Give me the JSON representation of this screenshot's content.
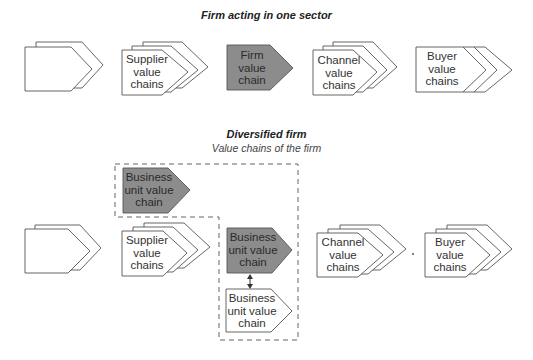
{
  "section_one": {
    "title": "Firm acting in one sector",
    "shapes": [
      {
        "id": "unlabeled",
        "label": "",
        "style": "white",
        "layers": 2
      },
      {
        "id": "supplier",
        "label": "Supplier\nvalue\nchains",
        "style": "white",
        "layers": 3
      },
      {
        "id": "firm",
        "label": "Firm\nvalue\nchain",
        "style": "gray",
        "layers": 1
      },
      {
        "id": "channel",
        "label": "Channel\nvalue\nchains",
        "style": "white",
        "layers": 3
      },
      {
        "id": "buyer",
        "label": "Buyer\nvalue\nchains",
        "style": "white",
        "layers": "3 chevrons"
      }
    ]
  },
  "section_two": {
    "title": "Diversified firm",
    "subtitle": "Value chains of the firm",
    "shapes": [
      {
        "id": "bu-top",
        "label": "Business\nunit value\nchain",
        "style": "gray"
      },
      {
        "id": "unlabeled",
        "label": "",
        "style": "white",
        "layers": 2
      },
      {
        "id": "supplier",
        "label": "Supplier\nvalue\nchains",
        "style": "white",
        "layers": 3
      },
      {
        "id": "bu-middle",
        "label": "Business\nunit value\nchain",
        "style": "gray"
      },
      {
        "id": "bu-bottom",
        "label": "Business\nunit value\nchain",
        "style": "white"
      },
      {
        "id": "channel",
        "label": "Channel\nvalue\nchains",
        "style": "white",
        "layers": 3
      },
      {
        "id": "buyer",
        "label": "Buyer\nvalue\nchains",
        "style": "white",
        "layers": 3
      }
    ],
    "connector": "double-headed arrow between business unit value chains"
  },
  "colors": {
    "gray_fill": "#8c8c8c",
    "stroke": "#555555",
    "background": "#ffffff"
  }
}
